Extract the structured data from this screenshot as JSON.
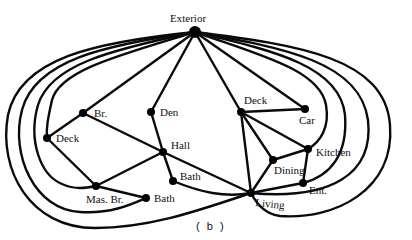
{
  "figure": {
    "caption": "( b )",
    "stroke_color": "#0a0a0a",
    "background": "#ffffff"
  },
  "nodes": [
    {
      "id": "exterior",
      "label": "Exterior",
      "x": 195,
      "y": 32,
      "r": 6,
      "lx": 170,
      "ly": 22
    },
    {
      "id": "br",
      "label": "Br.",
      "x": 83,
      "y": 113,
      "r": 4,
      "lx": 94,
      "ly": 117
    },
    {
      "id": "den",
      "label": "Den",
      "x": 151,
      "y": 112,
      "r": 4,
      "lx": 160,
      "ly": 116
    },
    {
      "id": "deck_left",
      "label": "Deck",
      "x": 47,
      "y": 138,
      "r": 4,
      "lx": 56,
      "ly": 142
    },
    {
      "id": "hall",
      "label": "Hall",
      "x": 163,
      "y": 152,
      "r": 4,
      "lx": 171,
      "ly": 149
    },
    {
      "id": "bath_hall",
      "label": "Bath",
      "x": 173,
      "y": 181,
      "r": 4,
      "lx": 180,
      "ly": 180
    },
    {
      "id": "mas_br",
      "label": "Mas. Br.",
      "x": 96,
      "y": 186,
      "r": 4,
      "lx": 86,
      "ly": 203
    },
    {
      "id": "bath_low",
      "label": "Bath",
      "x": 146,
      "y": 198,
      "r": 4,
      "lx": 154,
      "ly": 202
    },
    {
      "id": "deck_right",
      "label": "Deck",
      "x": 241,
      "y": 112,
      "r": 4,
      "lx": 244,
      "ly": 104
    },
    {
      "id": "car",
      "label": "Car",
      "x": 305,
      "y": 109,
      "r": 4,
      "lx": 299,
      "ly": 124
    },
    {
      "id": "kitchen",
      "label": "Kitchen",
      "x": 308,
      "y": 149,
      "r": 4,
      "lx": 316,
      "ly": 156
    },
    {
      "id": "dining",
      "label": "Dining",
      "x": 273,
      "y": 160,
      "r": 4,
      "lx": 274,
      "ly": 174
    },
    {
      "id": "ent",
      "label": "Ent.",
      "x": 303,
      "y": 183,
      "r": 4,
      "lx": 309,
      "ly": 194
    },
    {
      "id": "living",
      "label": "Living",
      "x": 251,
      "y": 193,
      "r": 4,
      "lx": 255,
      "ly": 206
    }
  ],
  "edges": [
    {
      "from": "exterior",
      "to": "br",
      "d": "M195,32 L83,113"
    },
    {
      "from": "exterior",
      "to": "den",
      "d": "M195,32 L151,112"
    },
    {
      "from": "exterior",
      "to": "deck_right",
      "d": "M195,32 L241,112"
    },
    {
      "from": "exterior",
      "to": "car",
      "d": "M195,32 L305,109"
    },
    {
      "from": "exterior",
      "to": "deck_left",
      "d": "M195,32 C120,55 60,70 52,100 C48,118 46,128 47,138"
    },
    {
      "from": "exterior",
      "to": "mas_br",
      "d": "M195,32 C110,50 50,65 38,105 C28,140 40,175 62,184 C75,190 86,188 96,186"
    },
    {
      "from": "exterior",
      "to": "bath_low",
      "d": "M195,32 C105,45 35,60 22,110 C10,155 35,210 80,212 C110,214 130,205 146,198"
    },
    {
      "from": "exterior",
      "to": "living_outer_left",
      "d": "M195,32 C95,42 20,58 8,115 C-2,170 30,228 95,228 C150,228 200,210 251,193"
    },
    {
      "from": "exterior",
      "to": "kitchen",
      "d": "M195,32 C260,55 320,70 326,105 C330,128 320,142 308,149"
    },
    {
      "from": "exterior",
      "to": "ent",
      "d": "M195,32 C270,50 340,65 345,115 C348,155 330,176 303,183"
    },
    {
      "from": "exterior",
      "to": "living",
      "d": "M195,32 C285,48 360,62 368,120 C374,175 330,200 251,193"
    },
    {
      "from": "exterior",
      "to": "living_outer_right",
      "d": "M195,32 C300,45 385,58 390,125 C395,190 335,220 280,216 C265,214 257,205 251,193"
    },
    {
      "from": "br",
      "to": "deck_left",
      "d": "M83,113 L47,138"
    },
    {
      "from": "br",
      "to": "hall",
      "d": "M83,113 L163,152"
    },
    {
      "from": "den",
      "to": "hall",
      "d": "M151,112 L163,152"
    },
    {
      "from": "deck_left",
      "to": "mas_br",
      "d": "M47,138 L96,186"
    },
    {
      "from": "mas_br",
      "to": "hall",
      "d": "M96,186 L163,152"
    },
    {
      "from": "mas_br",
      "to": "bath_low",
      "d": "M96,186 L146,198"
    },
    {
      "from": "hall",
      "to": "bath_hall",
      "d": "M163,152 L173,181"
    },
    {
      "from": "hall",
      "to": "living",
      "d": "M163,152 L251,193"
    },
    {
      "from": "bath_hall",
      "to": "living",
      "d": "M173,181 C200,192 225,198 251,193"
    },
    {
      "from": "deck_right",
      "to": "car",
      "d": "M241,112 L305,109"
    },
    {
      "from": "deck_right",
      "to": "kitchen",
      "d": "M241,112 L308,149"
    },
    {
      "from": "deck_right",
      "to": "dining",
      "d": "M241,112 L273,160"
    },
    {
      "from": "deck_right",
      "to": "living",
      "d": "M241,112 L251,193"
    },
    {
      "from": "dining",
      "to": "kitchen",
      "d": "M273,160 L308,149"
    },
    {
      "from": "dining",
      "to": "living",
      "d": "M273,160 L251,193"
    },
    {
      "from": "kitchen",
      "to": "ent",
      "d": "M308,149 L303,183"
    },
    {
      "from": "ent",
      "to": "living",
      "d": "M303,183 L251,193"
    }
  ]
}
